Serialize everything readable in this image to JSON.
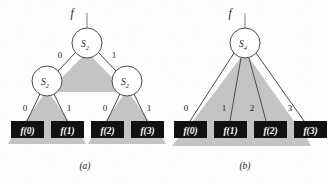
{
  "figure": {
    "background_color": "#fdfdfd",
    "node_fill": "#ffffff",
    "node_stroke": "#4a4a4a",
    "shadow_color": "#c4c4c4",
    "leaf_fill": "#111111",
    "leaf_text_color": "#ffffff"
  },
  "panels": [
    {
      "id": "a",
      "caption": "(a)",
      "input_label": "f",
      "nodes": [
        {
          "id": "a-root",
          "label": "S",
          "subscript": "2",
          "cx": 87,
          "cy": 43,
          "r": 15
        },
        {
          "id": "a-left",
          "label": "S",
          "subscript": "2",
          "cx": 47,
          "cy": 81,
          "r": 15
        },
        {
          "id": "a-right",
          "label": "S",
          "subscript": "2",
          "cx": 127,
          "cy": 81,
          "r": 15
        }
      ],
      "edges": [
        {
          "from": "a-root",
          "to": "a-left",
          "label": "0",
          "lx": 60,
          "ly": 55
        },
        {
          "from": "a-root",
          "to": "a-right",
          "label": "1",
          "lx": 114,
          "ly": 55
        },
        {
          "from": "a-left",
          "to": "leaf-0",
          "label": "0",
          "lx": 25,
          "ly": 108
        },
        {
          "from": "a-left",
          "to": "leaf-1",
          "label": "1",
          "lx": 68,
          "ly": 108
        },
        {
          "from": "a-right",
          "to": "leaf-2",
          "label": "0",
          "lx": 105,
          "ly": 108
        },
        {
          "from": "a-right",
          "to": "leaf-3",
          "label": "1",
          "lx": 148,
          "ly": 108
        }
      ],
      "leaves": [
        {
          "id": "leaf-0",
          "label": "f(0)",
          "x": 11,
          "y": 121,
          "w": 33,
          "h": 17
        },
        {
          "id": "leaf-1",
          "label": "f(1)",
          "x": 51,
          "y": 121,
          "w": 33,
          "h": 17
        },
        {
          "id": "leaf-2",
          "label": "f(2)",
          "x": 91,
          "y": 121,
          "w": 33,
          "h": 17
        },
        {
          "id": "leaf-3",
          "label": "f(3)",
          "x": 131,
          "y": 121,
          "w": 33,
          "h": 17
        }
      ]
    },
    {
      "id": "b",
      "caption": "(b)",
      "input_label": "f",
      "nodes": [
        {
          "id": "b-root",
          "label": "S",
          "subscript": "4",
          "cx": 245,
          "cy": 43,
          "r": 15
        }
      ],
      "edges": [
        {
          "from": "b-root",
          "to": "leaf-b0",
          "label": "0",
          "lx": 185,
          "ly": 108
        },
        {
          "from": "b-root",
          "to": "leaf-b1",
          "label": "1",
          "lx": 225,
          "ly": 108
        },
        {
          "from": "b-root",
          "to": "leaf-b2",
          "label": "2",
          "lx": 252,
          "ly": 108
        },
        {
          "from": "b-root",
          "to": "leaf-b3",
          "label": "3",
          "lx": 290,
          "ly": 108
        }
      ],
      "leaves": [
        {
          "id": "leaf-b0",
          "label": "f(0)",
          "x": 174,
          "y": 121,
          "w": 33,
          "h": 17
        },
        {
          "id": "leaf-b1",
          "label": "f(1)",
          "x": 214,
          "y": 121,
          "w": 33,
          "h": 17
        },
        {
          "id": "leaf-b2",
          "label": "f(2)",
          "x": 254,
          "y": 121,
          "w": 33,
          "h": 17
        },
        {
          "id": "leaf-b3",
          "label": "f(3)",
          "x": 294,
          "y": 121,
          "w": 33,
          "h": 17
        }
      ]
    }
  ]
}
